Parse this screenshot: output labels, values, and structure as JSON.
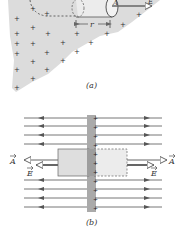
{
  "figure": {
    "panel_a": {
      "caption": "(a)",
      "radius_label": "r",
      "field_label": "E",
      "area_label": "A",
      "charge_symbol": "+"
    },
    "panel_b": {
      "caption": "(b)",
      "left_area_label": "A",
      "left_field_label": "E",
      "right_area_label": "A",
      "right_field_label": "E",
      "charge_symbol": "+"
    },
    "colors": {
      "sheet_fill": "#d9d9d9",
      "cylinder_fill": "#eaeaea",
      "line_color": "#555555",
      "arrow_color": "#666666"
    }
  }
}
